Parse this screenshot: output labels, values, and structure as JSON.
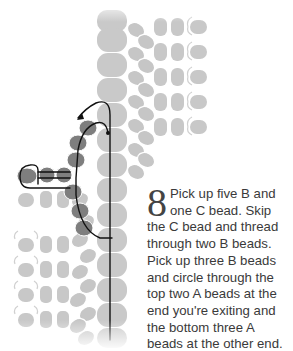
{
  "step": {
    "number": "8",
    "text": "Pick up five B and one C bead. Skip the C bead and thread through two B beads. Pick up three B beads and circle through the top two A beads at the end you're exiting and the bottom three A beads at the other end."
  },
  "colors": {
    "bead_light": "#c6c6c6",
    "bead_dark": "#7c7c7c",
    "thread": "#111111",
    "text": "#3a3a3a"
  }
}
